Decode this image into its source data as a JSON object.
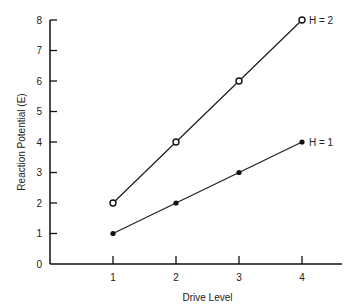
{
  "chart_data": {
    "type": "line",
    "title": "",
    "xlabel": "Drive Level",
    "ylabel": "Reaction Potential (E)",
    "x": [
      1,
      2,
      3,
      4
    ],
    "xticks": [
      "1",
      "2",
      "3",
      "4"
    ],
    "yticks": [
      "0",
      "1",
      "2",
      "3",
      "4",
      "5",
      "6",
      "7",
      "8"
    ],
    "xlim": [
      0,
      4.6
    ],
    "ylim": [
      0,
      8
    ],
    "grid": false,
    "legend_position": "inline-right-of-series",
    "series": [
      {
        "name": "H = 2",
        "values": [
          2,
          4,
          6,
          8
        ],
        "marker": "open-circle"
      },
      {
        "name": "H = 1",
        "values": [
          1,
          2,
          3,
          4
        ],
        "marker": "filled-circle"
      }
    ]
  }
}
